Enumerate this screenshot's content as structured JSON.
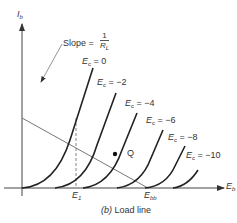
{
  "figure": {
    "caption": "(b) Load line",
    "caption_prefix": "(b)",
    "caption_text": "Load line"
  },
  "axes": {
    "y_label": "I",
    "y_label_sub": "b",
    "x_label": "E",
    "x_label_sub": "b"
  },
  "annotations": {
    "slope_label": "Slope =",
    "slope_numerator": "1",
    "slope_denominator": "R",
    "slope_denominator_sub": "L",
    "q_point": "Q",
    "e1_label": "E",
    "e1_sub": "1",
    "ebb_label": "E",
    "ebb_sub": "bb"
  },
  "curves": [
    {
      "label": "E",
      "sub": "c",
      "value": "= 0"
    },
    {
      "label": "E",
      "sub": "c",
      "value": "= −2"
    },
    {
      "label": "E",
      "sub": "c",
      "value": "= −4"
    },
    {
      "label": "E",
      "sub": "c",
      "value": "= −6"
    },
    {
      "label": "E",
      "sub": "c",
      "value": "= −8"
    },
    {
      "label": "E",
      "sub": "c",
      "value": "= −10"
    }
  ],
  "colors": {
    "curve": "#222222",
    "axis": "#333333",
    "load_line": "#666666"
  }
}
